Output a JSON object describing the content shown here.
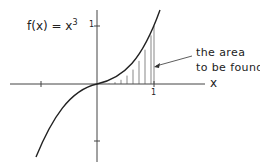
{
  "diagram": {
    "function_label": "f(x) = x",
    "function_exponent": "3",
    "annotation_line1": "the area",
    "annotation_line2": "to be found",
    "x_axis_label": "x",
    "x_tick_label": "1",
    "y_tick_label": "1",
    "colors": {
      "line": "#222222",
      "hatch": "#555555",
      "background": "#ffffff"
    }
  }
}
